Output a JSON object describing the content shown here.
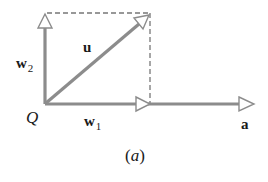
{
  "figure": {
    "caption": "(a)",
    "colors": {
      "vector": "#8c8c8c",
      "dashed": "#777777",
      "text": "#1a1a1a",
      "background": "#ffffff"
    },
    "origin": {
      "label": "Q",
      "x": 45,
      "y": 104
    },
    "vectors": [
      {
        "id": "u",
        "label": "u",
        "from": [
          45,
          104
        ],
        "to": [
          149,
          15
        ]
      },
      {
        "id": "w1",
        "label": "w",
        "subscript": "1",
        "from": [
          45,
          104
        ],
        "to": [
          150,
          104
        ]
      },
      {
        "id": "w2",
        "label": "w",
        "subscript": "2",
        "from": [
          45,
          104
        ],
        "to": [
          45,
          13
        ]
      },
      {
        "id": "a",
        "label": "a",
        "from": [
          45,
          104
        ],
        "to": [
          253,
          104
        ]
      }
    ],
    "dashed_lines": [
      {
        "from": [
          45,
          13
        ],
        "to": [
          150,
          13
        ]
      },
      {
        "from": [
          150,
          13
        ],
        "to": [
          150,
          104
        ]
      }
    ]
  }
}
